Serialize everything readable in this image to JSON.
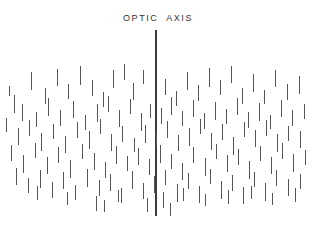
{
  "figure": {
    "width": 316,
    "height": 231,
    "background_color": "#ffffff",
    "title": "OPTIC  AXIS",
    "title_color": "#333333",
    "tick_color": "#555555",
    "axis_color": "#3c3c3c"
  },
  "optic_axis": {
    "label": "OPTIC  AXIS",
    "x": 155,
    "y_top": 30,
    "y_bottom": 216,
    "width": 2
  },
  "chart_data": {
    "type": "scatter",
    "title": "OPTIC  AXIS",
    "xlabel": "",
    "ylabel": "",
    "xlim": [
      0,
      316
    ],
    "ylim": [
      0,
      231
    ],
    "grid": false,
    "legend": null,
    "marker": "vertical-line-segment",
    "count": 148,
    "segments": [
      [
        14,
        95,
        18
      ],
      [
        31,
        72,
        18
      ],
      [
        45,
        88,
        16
      ],
      [
        57,
        69,
        17
      ],
      [
        68,
        84,
        15
      ],
      [
        80,
        66,
        19
      ],
      [
        92,
        80,
        16
      ],
      [
        103,
        92,
        15
      ],
      [
        113,
        70,
        18
      ],
      [
        124,
        64,
        16
      ],
      [
        133,
        83,
        17
      ],
      [
        143,
        70,
        14
      ],
      [
        165,
        79,
        16
      ],
      [
        176,
        91,
        15
      ],
      [
        187,
        72,
        18
      ],
      [
        198,
        85,
        16
      ],
      [
        209,
        68,
        19
      ],
      [
        220,
        80,
        15
      ],
      [
        231,
        66,
        17
      ],
      [
        242,
        88,
        16
      ],
      [
        253,
        74,
        18
      ],
      [
        264,
        90,
        14
      ],
      [
        275,
        70,
        17
      ],
      [
        287,
        84,
        16
      ],
      [
        299,
        76,
        18
      ],
      [
        9,
        86,
        10
      ],
      [
        22,
        104,
        17
      ],
      [
        36,
        112,
        15
      ],
      [
        48,
        98,
        18
      ],
      [
        60,
        110,
        16
      ],
      [
        73,
        101,
        17
      ],
      [
        85,
        115,
        15
      ],
      [
        97,
        104,
        18
      ],
      [
        108,
        96,
        16
      ],
      [
        119,
        110,
        17
      ],
      [
        130,
        99,
        15
      ],
      [
        141,
        113,
        18
      ],
      [
        150,
        104,
        14
      ],
      [
        161,
        108,
        16
      ],
      [
        171,
        97,
        18
      ],
      [
        182,
        111,
        15
      ],
      [
        193,
        100,
        17
      ],
      [
        204,
        113,
        16
      ],
      [
        215,
        102,
        18
      ],
      [
        226,
        109,
        15
      ],
      [
        237,
        98,
        17
      ],
      [
        248,
        112,
        16
      ],
      [
        259,
        103,
        18
      ],
      [
        270,
        115,
        14
      ],
      [
        281,
        100,
        17
      ],
      [
        292,
        110,
        16
      ],
      [
        304,
        104,
        15
      ],
      [
        6,
        118,
        14
      ],
      [
        18,
        128,
        17
      ],
      [
        29,
        120,
        16
      ],
      [
        41,
        133,
        18
      ],
      [
        53,
        124,
        15
      ],
      [
        65,
        136,
        17
      ],
      [
        77,
        122,
        16
      ],
      [
        89,
        131,
        18
      ],
      [
        100,
        119,
        15
      ],
      [
        111,
        134,
        17
      ],
      [
        122,
        126,
        16
      ],
      [
        134,
        138,
        14
      ],
      [
        145,
        125,
        18
      ],
      [
        156,
        132,
        15
      ],
      [
        167,
        121,
        17
      ],
      [
        178,
        135,
        16
      ],
      [
        189,
        128,
        18
      ],
      [
        200,
        119,
        15
      ],
      [
        211,
        133,
        17
      ],
      [
        222,
        124,
        16
      ],
      [
        233,
        137,
        18
      ],
      [
        244,
        122,
        15
      ],
      [
        255,
        130,
        17
      ],
      [
        266,
        120,
        16
      ],
      [
        277,
        134,
        18
      ],
      [
        288,
        126,
        15
      ],
      [
        300,
        131,
        17
      ],
      [
        11,
        145,
        16
      ],
      [
        23,
        155,
        18
      ],
      [
        35,
        143,
        15
      ],
      [
        47,
        157,
        17
      ],
      [
        58,
        147,
        16
      ],
      [
        70,
        160,
        18
      ],
      [
        82,
        144,
        15
      ],
      [
        94,
        153,
        17
      ],
      [
        105,
        162,
        16
      ],
      [
        116,
        146,
        18
      ],
      [
        127,
        156,
        15
      ],
      [
        138,
        148,
        17
      ],
      [
        149,
        159,
        16
      ],
      [
        160,
        145,
        18
      ],
      [
        171,
        154,
        15
      ],
      [
        182,
        163,
        17
      ],
      [
        193,
        147,
        16
      ],
      [
        205,
        158,
        18
      ],
      [
        216,
        144,
        15
      ],
      [
        227,
        155,
        17
      ],
      [
        238,
        149,
        16
      ],
      [
        249,
        161,
        18
      ],
      [
        260,
        146,
        15
      ],
      [
        271,
        157,
        17
      ],
      [
        282,
        143,
        16
      ],
      [
        293,
        154,
        18
      ],
      [
        305,
        150,
        15
      ],
      [
        16,
        168,
        17
      ],
      [
        28,
        178,
        15
      ],
      [
        40,
        170,
        18
      ],
      [
        52,
        182,
        16
      ],
      [
        63,
        172,
        17
      ],
      [
        75,
        185,
        15
      ],
      [
        87,
        169,
        18
      ],
      [
        99,
        180,
        16
      ],
      [
        110,
        174,
        17
      ],
      [
        121,
        188,
        15
      ],
      [
        132,
        171,
        18
      ],
      [
        143,
        183,
        16
      ],
      [
        154,
        176,
        17
      ],
      [
        165,
        170,
        15
      ],
      [
        177,
        184,
        18
      ],
      [
        188,
        173,
        16
      ],
      [
        199,
        186,
        17
      ],
      [
        210,
        169,
        15
      ],
      [
        221,
        181,
        18
      ],
      [
        232,
        175,
        16
      ],
      [
        243,
        187,
        17
      ],
      [
        254,
        172,
        15
      ],
      [
        265,
        183,
        18
      ],
      [
        276,
        170,
        16
      ],
      [
        288,
        179,
        17
      ],
      [
        300,
        174,
        15
      ],
      [
        37,
        186,
        14
      ],
      [
        67,
        192,
        13
      ],
      [
        96,
        196,
        15
      ],
      [
        118,
        190,
        12
      ],
      [
        147,
        198,
        14
      ],
      [
        163,
        192,
        16
      ],
      [
        183,
        188,
        13
      ],
      [
        205,
        194,
        12
      ],
      [
        228,
        190,
        14
      ],
      [
        251,
        186,
        13
      ],
      [
        272,
        193,
        12
      ],
      [
        295,
        188,
        14
      ],
      [
        104,
        200,
        12
      ],
      [
        170,
        203,
        13
      ]
    ]
  }
}
